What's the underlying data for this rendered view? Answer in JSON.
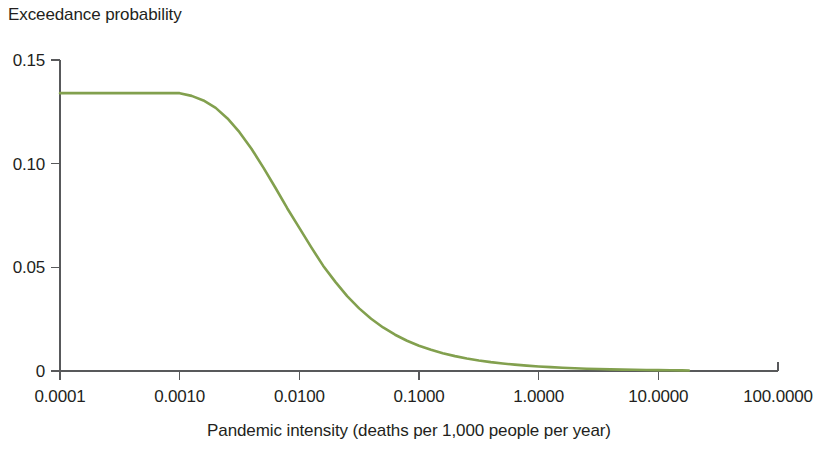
{
  "chart_data": {
    "type": "line",
    "title": "Exceedance probability",
    "subtitle": "",
    "xlabel": "Pandemic intensity (deaths per 1,000 people per year)",
    "ylabel": "Exceedance probability",
    "xscale": "log",
    "yscale": "linear",
    "xlim": [
      0.0001,
      100.0
    ],
    "ylim": [
      0,
      0.15
    ],
    "grid": false,
    "legend": false,
    "legend_position": "none",
    "xtick_labels": [
      "0.0001",
      "0.0010",
      "0.0100",
      "0.1000",
      "1.0000",
      "10.0000",
      "100.0000"
    ],
    "xtick_values": [
      0.0001,
      0.001,
      0.01,
      0.1,
      1,
      10,
      100
    ],
    "ytick_labels": [
      "0.15",
      "0.10",
      "0.05",
      "0"
    ],
    "ytick_values": [
      0.15,
      0.1,
      0.05,
      0
    ],
    "series": [
      {
        "name": "Exceedance probability",
        "color": "#82a04e",
        "x": [
          0.0001,
          0.000158,
          0.000251,
          0.000398,
          0.000631,
          0.001,
          0.00126,
          0.00158,
          0.002,
          0.00251,
          0.00316,
          0.00398,
          0.00501,
          0.00631,
          0.00794,
          0.01,
          0.0126,
          0.0158,
          0.02,
          0.0251,
          0.0316,
          0.0398,
          0.0501,
          0.0631,
          0.0794,
          0.1,
          0.126,
          0.158,
          0.2,
          0.251,
          0.316,
          0.398,
          0.501,
          0.631,
          0.794,
          1.0,
          1.26,
          1.58,
          2.0,
          2.51,
          3.16,
          3.98,
          5.01,
          6.31,
          7.94,
          10.0,
          12.6,
          15.8,
          18.0
        ],
        "y": [
          0.134,
          0.134,
          0.134,
          0.134,
          0.134,
          0.134,
          0.1327,
          0.1305,
          0.1269,
          0.1218,
          0.1152,
          0.1072,
          0.0981,
          0.0884,
          0.0784,
          0.069,
          0.0596,
          0.0508,
          0.043,
          0.0361,
          0.0302,
          0.0252,
          0.021,
          0.0175,
          0.0146,
          0.0122,
          0.0102,
          0.00855,
          0.00718,
          0.00604,
          0.00509,
          0.00429,
          0.00362,
          0.00306,
          0.00259,
          0.00219,
          0.00185,
          0.00157,
          0.00133,
          0.00112,
          0.00095,
          0.0008,
          0.00068,
          0.00057,
          0.00048,
          0.00041,
          0.00034,
          0.00029,
          0.00026
        ]
      }
    ],
    "annotations": []
  },
  "colors": {
    "series_green": "#82a04e",
    "axis_gray": "#58595b",
    "text": "#231f20",
    "background": "#ffffff"
  }
}
